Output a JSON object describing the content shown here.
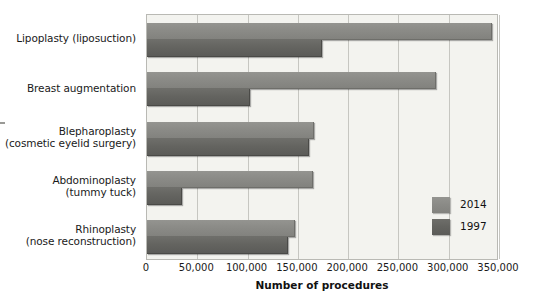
{
  "chart_data": {
    "type": "bar",
    "orientation": "horizontal",
    "title": "",
    "xlabel": "Number of procedures",
    "ylabel": "",
    "xlim": [
      0,
      350000
    ],
    "xticks": [
      0,
      50000,
      100000,
      150000,
      200000,
      250000,
      300000,
      350000
    ],
    "xticklabels": [
      "0",
      "50,000",
      "100,000",
      "150,000",
      "200,000",
      "250,000",
      "300,000",
      "350,000"
    ],
    "grid": true,
    "legend_position": "inside-lower-right",
    "categories": [
      "Lipoplasty (liposuction)",
      "Breast augmentation",
      "Blepharoplasty (cosmetic eyelid surgery)",
      "Abdominoplasty (tummy tuck)",
      "Rhinoplasty (nose reconstruction)"
    ],
    "category_lines": [
      [
        "Lipoplasty (liposuction)",
        ""
      ],
      [
        "Breast augmentation",
        ""
      ],
      [
        "Blepharoplasty",
        "(cosmetic eyelid surgery)"
      ],
      [
        "Abdominoplasty",
        "(tummy tuck)"
      ],
      [
        "Rhinoplasty",
        "(nose reconstruction)"
      ]
    ],
    "series": [
      {
        "name": "2014",
        "color": "#8b8b87",
        "values": [
          342000,
          286000,
          165000,
          164000,
          146000
        ]
      },
      {
        "name": "1997",
        "color": "#646460",
        "values": [
          173000,
          101000,
          160000,
          34000,
          139000
        ]
      }
    ]
  },
  "legend": {
    "entries": [
      {
        "label": "2014",
        "color": "#8b8b87"
      },
      {
        "label": "1997",
        "color": "#646460"
      }
    ]
  },
  "axis": {
    "x_title": "Number of procedures"
  }
}
